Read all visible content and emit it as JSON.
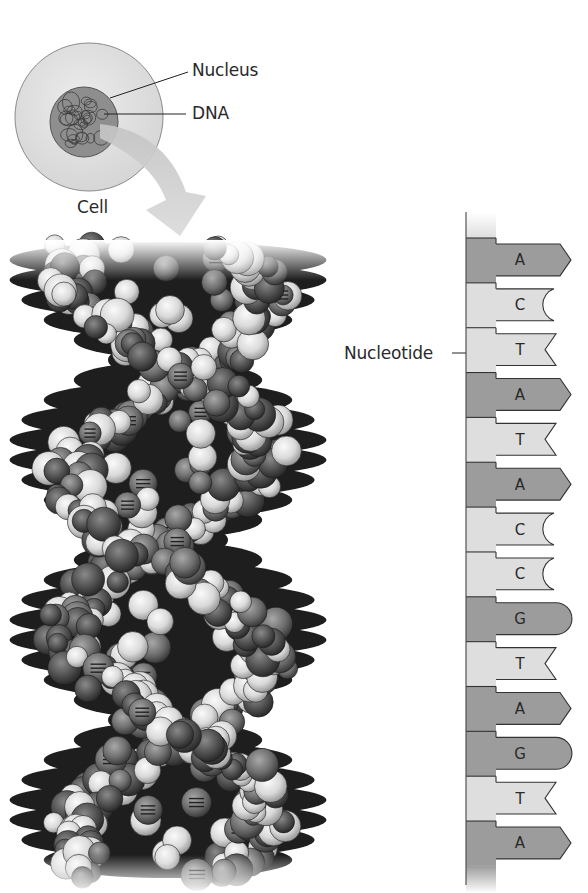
{
  "figure": {
    "cell_diagram": {
      "labels": {
        "nucleus": "Nucleus",
        "dna": "DNA",
        "cell": "Cell"
      },
      "colors": {
        "cell_fill": "#e2e2e2",
        "cell_stroke": "#8a8a8a",
        "nucleus_fill": "#8e8e8e",
        "arrow_fill": "#cfcfcf"
      }
    },
    "helix_model": {
      "description": "Space-filling DNA double helix model",
      "colors": {
        "dark_atom": "#5a5a5a",
        "light_atom": "#e4e4e4",
        "mid_atom": "#8a8a8a",
        "shadow": "#1e1e1e"
      }
    },
    "nucleotide_strand": {
      "label": "Nucleotide",
      "bases": [
        "A",
        "C",
        "T",
        "A",
        "T",
        "A",
        "C",
        "C",
        "G",
        "T",
        "A",
        "G",
        "T",
        "A"
      ],
      "shapes": {
        "A": "arrow",
        "C": "concave-arc",
        "T": "notch",
        "G": "rounded"
      },
      "colors": {
        "purine": "#9c9c9c",
        "pyrimidine": "#dedede",
        "stroke": "#333333",
        "backbone_top": "#f0f0f0"
      }
    }
  }
}
